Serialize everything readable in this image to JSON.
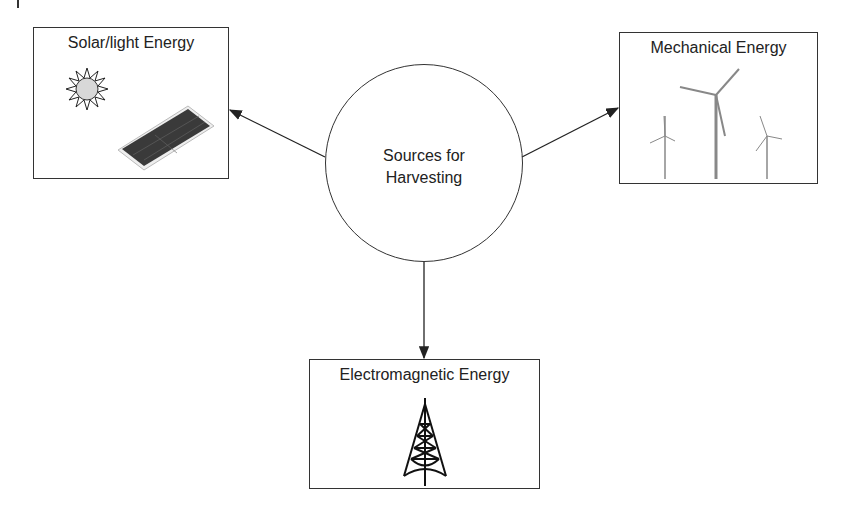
{
  "center": {
    "line1": "Sources for",
    "line2": "Harvesting"
  },
  "nodes": {
    "solar": {
      "title": "Solar/light Energy",
      "icons": [
        "sun-icon",
        "solar-panel-icon"
      ]
    },
    "mechanical": {
      "title": "Mechanical Energy",
      "icons": [
        "wind-turbine-icon"
      ]
    },
    "electromagnetic": {
      "title": "Electromagnetic Energy",
      "icons": [
        "radio-tower-icon"
      ]
    }
  },
  "colors": {
    "stroke": "#333333",
    "background": "#ffffff",
    "sun_fill": "#d8d8d8",
    "panel_fill": "#3a3a3a"
  }
}
